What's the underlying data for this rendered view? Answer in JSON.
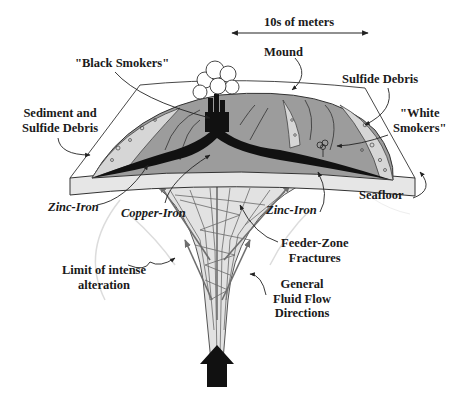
{
  "diagram": {
    "type": "cross-section",
    "scale": {
      "label": "10s of meters"
    },
    "labels": {
      "scale": "10s of meters",
      "mound": "Mound",
      "black_smokers": "\"Black Smokers\"",
      "sulfide_debris": "Sulfide Debris",
      "white_smokers_l1": "\"White",
      "white_smokers_l2": "Smokers\"",
      "sediment_l1": "Sediment and",
      "sediment_l2": "Sulfide Debris",
      "seafloor": "Seafloor",
      "zinc_iron_left": "Zinc-Iron",
      "copper_iron": "Copper-Iron",
      "zinc_iron_right": "Zinc-Iron",
      "feeder_l1": "Feeder-Zone",
      "feeder_l2": "Fractures",
      "limit_l1": "Limit of intense",
      "limit_l2": "alteration",
      "flow_l1": "General",
      "flow_l2": "Fluid Flow",
      "flow_l3": "Directions"
    },
    "colors": {
      "mound_fill": "#9c9c9c",
      "sulfide_band": "#111111",
      "seafloor_slab": "#e6e6e6",
      "debris_fill": "#d6d6d6",
      "outline": "#333333",
      "flow_arrow": "#6e6e6e",
      "upwelling_arrow": "#111111",
      "alteration_limit": "#dcdcdc"
    }
  }
}
